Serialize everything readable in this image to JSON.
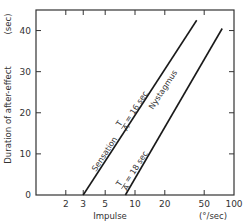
{
  "chart_data": {
    "type": "line",
    "title": "",
    "xlabel": "Impulse",
    "xunit": "(°/sec)",
    "ylabel": "Duration of after-effect",
    "yunit": "(sec)",
    "xscale": "log",
    "xlim": [
      1,
      100
    ],
    "ylim": [
      0,
      45
    ],
    "x_ticks": [
      2,
      3,
      5,
      10,
      20,
      50,
      100
    ],
    "y_ticks": [
      0,
      10,
      20,
      30,
      40
    ],
    "y_tick_labels": [
      "0",
      "10",
      "20",
      "30",
      "40"
    ],
    "x_tick_labels": [
      "2",
      "3",
      "5",
      "10",
      "20",
      "50",
      "100"
    ],
    "grid": false,
    "series": [
      {
        "name": "Sensation",
        "annotation": "T/A = 16 sec",
        "x": [
          3,
          42
        ],
        "y": [
          0,
          42.5
        ]
      },
      {
        "name": "Nystagmus",
        "annotation": "T/A = 18 sec",
        "x": [
          8,
          76
        ],
        "y": [
          0,
          40.5
        ]
      }
    ]
  },
  "labels": {
    "sensation": "Sensation",
    "nystagmus": "Nystagmus",
    "sensation_tc": "= 16 sec",
    "nystagmus_tc": "= 18 sec",
    "tc_numerator": "T",
    "tc_denominator": "A"
  }
}
